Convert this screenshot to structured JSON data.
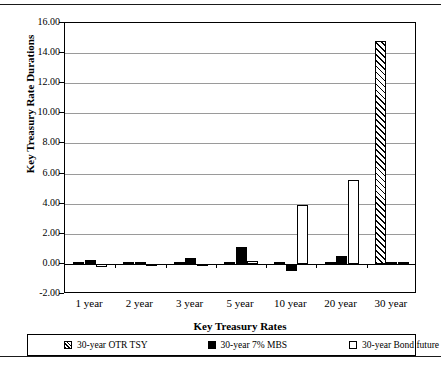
{
  "chart_data": {
    "type": "bar",
    "title": "",
    "xlabel": "Key Treasury Rates",
    "ylabel": "Key Treasury Rate Durations",
    "categories": [
      "1 year",
      "2 year",
      "3 year",
      "5 year",
      "10 year",
      "20 year",
      "30 year"
    ],
    "series": [
      {
        "name": "30-year OTR TSY",
        "fill": "hatched",
        "values": [
          0.02,
          0.01,
          0.01,
          0.02,
          0.01,
          0.15,
          14.8
        ]
      },
      {
        "name": "30-year 7% MBS",
        "fill": "solid-black",
        "values": [
          0.25,
          0.15,
          0.38,
          1.1,
          -0.45,
          0.55,
          0.06
        ]
      },
      {
        "name": "30-year Bond future",
        "fill": "white",
        "values": [
          -0.18,
          -0.03,
          -0.04,
          0.18,
          3.9,
          5.55,
          0.0
        ]
      }
    ],
    "ylim": [
      -2.0,
      16.0
    ],
    "ytick_values": [
      16.0,
      14.0,
      12.0,
      10.0,
      8.0,
      6.0,
      4.0,
      2.0,
      0.0,
      -2.0
    ],
    "ytick_labels": [
      "16.00",
      "14.00",
      "12.00",
      "10.00",
      "8.00",
      "6.00",
      "4.00",
      "2.00",
      "0.00",
      "-2.00"
    ],
    "grid": true,
    "legend_position": "bottom"
  },
  "legend": {
    "entries": [
      {
        "label": "30-year OTR TSY"
      },
      {
        "label": "30-year 7% MBS"
      },
      {
        "label": "30-year Bond future"
      }
    ]
  },
  "colors": {
    "axis": "#000000",
    "gridline": "#9a9a9a",
    "bar_solid": "#000000",
    "bar_white": "#ffffff",
    "background": "#ffffff"
  }
}
